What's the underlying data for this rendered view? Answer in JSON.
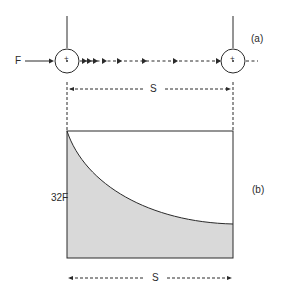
{
  "diagram": {
    "part_a": {
      "label": "(a)",
      "input_label": "F",
      "dimension_label": "S",
      "left_node_symbol": "+",
      "right_node_symbol": "+"
    },
    "part_b": {
      "label": "(b)",
      "y_label": "32F",
      "dimension_label": "S"
    },
    "colors": {
      "line": "#2a2a2a",
      "fill": "#d9d9d9",
      "background": "#ffffff"
    }
  }
}
